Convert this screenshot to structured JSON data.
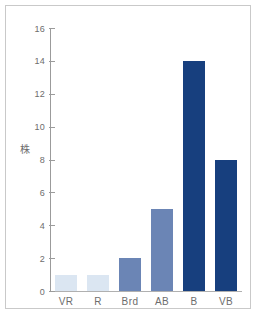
{
  "chart_data": {
    "type": "bar",
    "title": "",
    "subtitle": "",
    "xlabel": "",
    "ylabel": "株",
    "categories": [
      "VR",
      "R",
      "Brd",
      "AB",
      "B",
      "VB"
    ],
    "values": [
      1,
      1,
      2,
      5,
      14,
      8
    ],
    "series": [
      {
        "name": "",
        "values": [
          1,
          1,
          2,
          5,
          14,
          8
        ]
      }
    ],
    "bar_colors": [
      "#dbe6f2",
      "#dbe6f2",
      "#6b85b5",
      "#6b85b5",
      "#173f7e",
      "#173f7e"
    ],
    "ylim": [
      0,
      16
    ],
    "ytick_values": [
      0,
      2,
      4,
      6,
      8,
      10,
      12,
      14,
      16
    ],
    "ytick_labels": [
      "0",
      "2",
      "4",
      "6",
      "8",
      "10",
      "12",
      "14",
      "16"
    ],
    "ytick_step": 2,
    "grid": false,
    "legend": false,
    "legend_position": "none",
    "annotations": []
  },
  "style": {
    "background_color": "#ffffff",
    "frame_color": "#c9c9c9",
    "axis_color": "#9b9b9b",
    "baseline_color": "#b0b0b0",
    "tick_label_color": "#6d6d6d",
    "color_pale": "#dbe6f2",
    "color_medium": "#6b85b5",
    "color_dark": "#173f7e"
  }
}
